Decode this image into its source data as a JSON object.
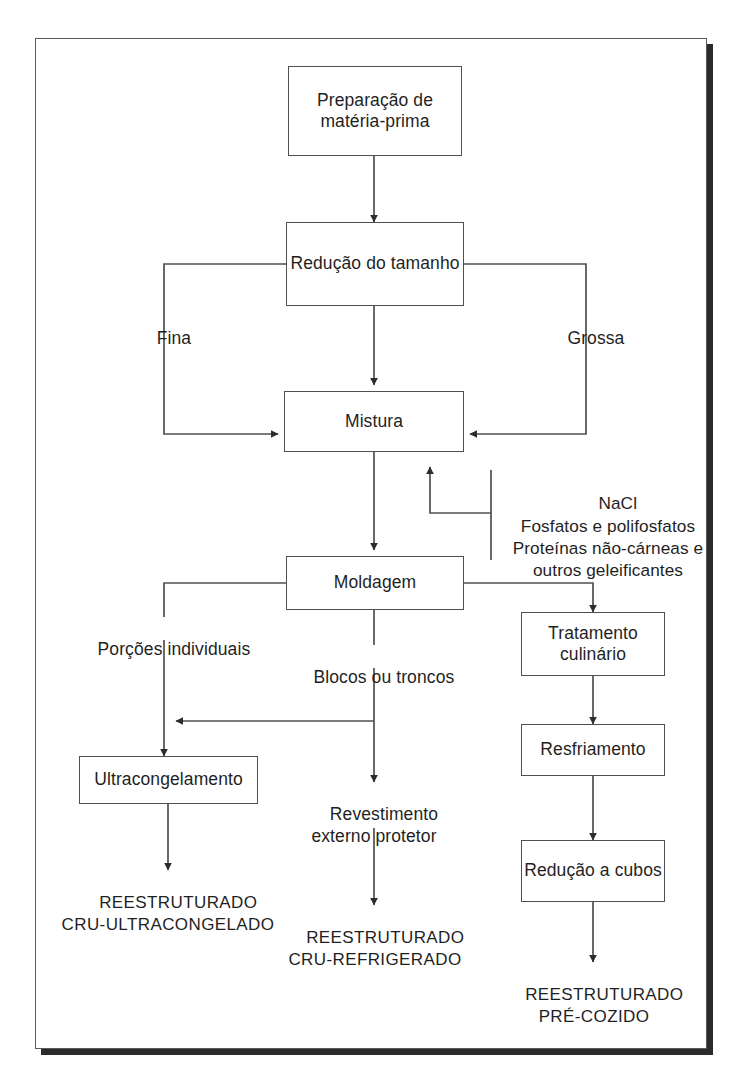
{
  "diagram": {
    "language": "pt-BR",
    "stroke_color": "#4d5154",
    "frame_color": "#555a5e",
    "shadow_color": "#2b2b2b",
    "text_color": "#1f1f1f",
    "background": "#ffffff"
  },
  "nodes": {
    "preparacao": "Preparação de\nmatéria-prima",
    "reducao_tamanho": "Redução\ndo tamanho",
    "mistura": "Mistura",
    "moldagem": "Moldagem",
    "tratamento_culinario": "Tratamento\nculinário",
    "resfriamento": "Resfriamento",
    "reducao_cubos": "Redução\na cubos",
    "ultracongelamento": "Ultracongelamento"
  },
  "edge_labels": {
    "fina": "Fina",
    "grossa": "Grossa",
    "porcoes_individuais": "Porções individuais",
    "blocos_ou_troncos": "Blocos ou troncos",
    "revestimento": "Revestimento\nexterno protetor"
  },
  "ingredients": {
    "lines": "NaCl\nFosfatos e polifosfatos\nProteínas não-cárneas e\noutros geleificantes"
  },
  "outputs": {
    "cru_ultracongelado": "REESTRUTURADO\nCRU-ULTRACONGELADO",
    "cru_refrigerado": "REESTRUTURADO\nCRU-REFRIGERADO",
    "pre_cozido": "REESTRUTURADO\nPRÉ-COZIDO"
  }
}
